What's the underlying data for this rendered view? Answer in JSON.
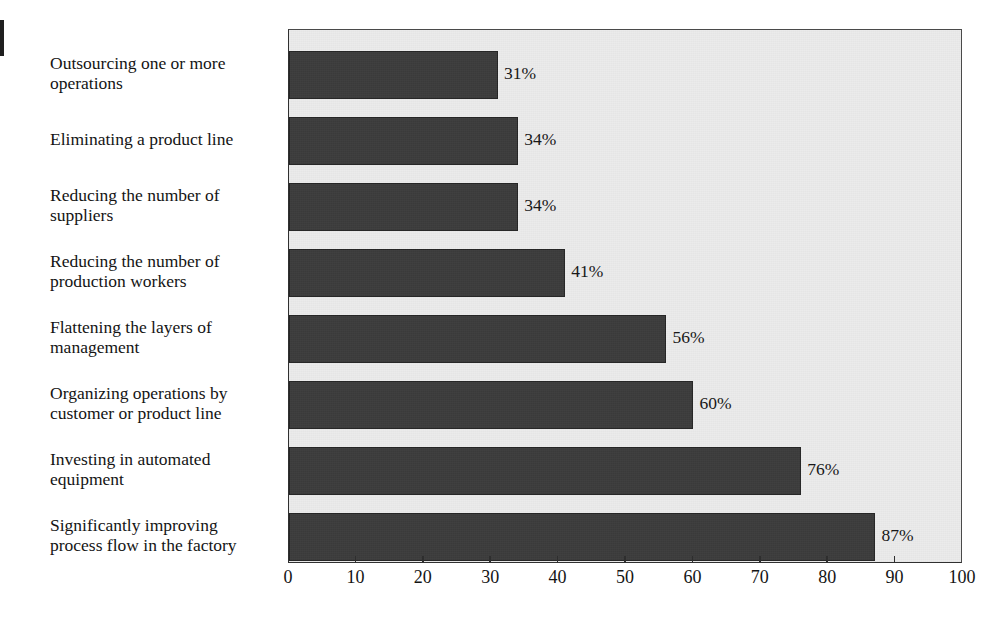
{
  "chart_data": {
    "type": "bar",
    "orientation": "horizontal",
    "title": "",
    "subtitle": "",
    "xlabel": "",
    "ylabel": "",
    "xlim": [
      0,
      100
    ],
    "xticks": [
      0,
      10,
      20,
      30,
      40,
      50,
      60,
      70,
      80,
      90,
      100
    ],
    "xtick_labels": [
      "0",
      "10",
      "20",
      "30",
      "40",
      "50",
      "60",
      "70",
      "80",
      "90",
      "100"
    ],
    "grid": false,
    "legend": null,
    "categories": [
      "Outsourcing one or more operations",
      "Eliminating a product line",
      "Reducing the number of suppliers",
      "Reducing the number of production workers",
      "Flattening the layers of management",
      "Organizing operations by customer or product line",
      "Investing in automated equipment",
      "Significantly improving process flow in the factory"
    ],
    "category_lines": [
      [
        "Outsourcing one or more",
        "operations"
      ],
      [
        "Eliminating a product line"
      ],
      [
        "Reducing the number of",
        "suppliers"
      ],
      [
        "Reducing the number of",
        "production workers"
      ],
      [
        "Flattening the layers of",
        "management"
      ],
      [
        "Organizing operations by",
        "customer or product line"
      ],
      [
        "Investing in automated",
        "equipment"
      ],
      [
        "Significantly improving",
        "process flow in the factory"
      ]
    ],
    "values": [
      31,
      34,
      34,
      41,
      56,
      60,
      76,
      87
    ],
    "value_labels": [
      "31%",
      "34%",
      "34%",
      "41%",
      "56%",
      "60%",
      "76%",
      "87%"
    ],
    "colors": {
      "bar_fill": "#3c3c3c",
      "bar_edge": "#242424",
      "plot_background": "#ebebeb",
      "axis": "#2e2e2e",
      "text": "#141414",
      "page_background": "#ffffff"
    }
  }
}
